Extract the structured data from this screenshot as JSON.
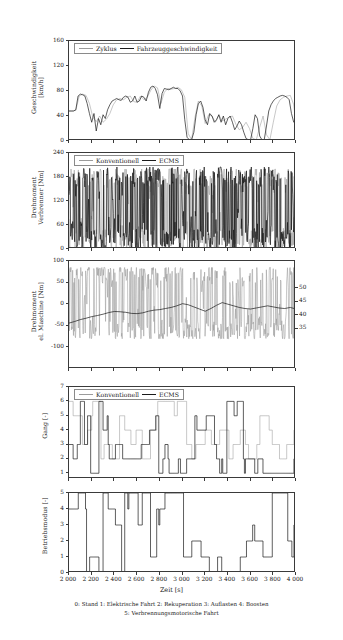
{
  "figure": {
    "width": 343,
    "height": 640,
    "background": "#ffffff",
    "axis_color": "#3a3a3a",
    "grey_series_color": "#9b9b9b",
    "black_series_color": "#1a1a1a"
  },
  "xaxis": {
    "label": "Zeit [s]",
    "ticks": [
      2000,
      2200,
      2400,
      2600,
      2800,
      3000,
      3200,
      3400,
      3600,
      3800,
      4000
    ],
    "tick_labels": [
      "2 000",
      "2 200",
      "2 400",
      "2 600",
      "2 800",
      "3 000",
      "3 200",
      "3 400",
      "3 600",
      "3 800",
      "4 000"
    ],
    "min": 2000,
    "max": 4000
  },
  "caption": {
    "line1": "0: Stand 1: Elektrische Fahrt 2: Rekuperation 3: Auflasten 4: Boosten",
    "line2": "5: Verbrennungsmotorische Fahrt"
  },
  "chart_data": [
    {
      "id": "speed",
      "type": "line",
      "title": "",
      "xlabel": "",
      "ylabel": "Geschwindigkeit\n[km/h]",
      "ylabel_lines": [
        "Geschwindigkeit",
        "[km/h]"
      ],
      "ylim": [
        0,
        160
      ],
      "yticks": [
        0,
        40,
        80,
        120,
        160
      ],
      "ytick_labels": [
        "0",
        "40",
        "80",
        "120",
        "160"
      ],
      "xlim": [
        2000,
        4000
      ],
      "grid": false,
      "legend": {
        "position": "top-left-inside",
        "entries": [
          {
            "name": "Zyklus",
            "color": "#9b9b9b"
          },
          {
            "name": "Fahrzeuggeschwindigkeit",
            "color": "#1a1a1a"
          }
        ]
      },
      "series": [
        {
          "name": "Zyklus",
          "color": "#9b9b9b",
          "x": [
            2000,
            2030,
            2060,
            2090,
            2120,
            2150,
            2180,
            2210,
            2240,
            2270,
            2300,
            2330,
            2360,
            2390,
            2420,
            2450,
            2480,
            2510,
            2540,
            2570,
            2600,
            2630,
            2660,
            2690,
            2720,
            2750,
            2780,
            2810,
            2840,
            2870,
            2900,
            2930,
            2960,
            2990,
            3020,
            3050,
            3080,
            3110,
            3140,
            3170,
            3200,
            3230,
            3260,
            3290,
            3320,
            3350,
            3380,
            3410,
            3440,
            3470,
            3500,
            3530,
            3560,
            3590,
            3620,
            3650,
            3680,
            3710,
            3740,
            3770,
            3800,
            3830,
            3860,
            3890,
            3920,
            3950,
            3980,
            4000
          ],
          "y": [
            48,
            48,
            49,
            72,
            75,
            73,
            60,
            38,
            31,
            40,
            30,
            35,
            44,
            58,
            66,
            68,
            66,
            70,
            72,
            63,
            62,
            72,
            66,
            70,
            81,
            88,
            85,
            60,
            78,
            84,
            83,
            84,
            86,
            82,
            70,
            12,
            2,
            38,
            64,
            56,
            28,
            42,
            40,
            30,
            42,
            32,
            35,
            38,
            40,
            27,
            18,
            22,
            30,
            20,
            4,
            2,
            22,
            40,
            10,
            2,
            30,
            56,
            66,
            70,
            72,
            73,
            58,
            27
          ]
        },
        {
          "name": "Fahrzeuggeschwindigkeit",
          "color": "#1a1a1a",
          "x": [
            2000,
            2020,
            2040,
            2060,
            2080,
            2100,
            2120,
            2140,
            2160,
            2180,
            2200,
            2220,
            2240,
            2260,
            2280,
            2300,
            2320,
            2340,
            2360,
            2380,
            2400,
            2420,
            2440,
            2460,
            2480,
            2500,
            2520,
            2540,
            2560,
            2580,
            2600,
            2620,
            2640,
            2660,
            2680,
            2700,
            2720,
            2740,
            2760,
            2780,
            2800,
            2820,
            2840,
            2860,
            2880,
            2900,
            2920,
            2940,
            2960,
            2980,
            3000,
            3020,
            3040,
            3060,
            3080,
            3100,
            3120,
            3140,
            3160,
            3180,
            3200,
            3220,
            3240,
            3260,
            3280,
            3300,
            3320,
            3340,
            3360,
            3380,
            3400,
            3420,
            3440,
            3460,
            3480,
            3500,
            3520,
            3540,
            3560,
            3580,
            3600,
            3620,
            3640,
            3660,
            3680,
            3700,
            3720,
            3740,
            3760,
            3780,
            3800,
            3820,
            3840,
            3860,
            3880,
            3900,
            3920,
            3940,
            3960,
            3980,
            4000
          ],
          "y": [
            48,
            48,
            48,
            50,
            72,
            75,
            74,
            72,
            60,
            44,
            30,
            44,
            16,
            36,
            26,
            42,
            36,
            50,
            58,
            64,
            66,
            68,
            66,
            65,
            70,
            72,
            70,
            62,
            64,
            72,
            62,
            64,
            72,
            70,
            64,
            78,
            86,
            88,
            84,
            74,
            52,
            76,
            84,
            83,
            82,
            84,
            86,
            84,
            84,
            80,
            72,
            34,
            6,
            2,
            2,
            14,
            42,
            60,
            64,
            54,
            34,
            26,
            44,
            40,
            30,
            34,
            42,
            30,
            40,
            26,
            36,
            40,
            30,
            18,
            24,
            32,
            26,
            14,
            4,
            2,
            2,
            20,
            42,
            36,
            8,
            2,
            2,
            24,
            48,
            58,
            64,
            68,
            70,
            72,
            73,
            72,
            70,
            66,
            44,
            30,
            27
          ]
        }
      ]
    },
    {
      "id": "engine_torque",
      "type": "line",
      "title": "",
      "xlabel": "",
      "ylabel": "Drehmoment\nVerbrenner [Nm]",
      "ylabel_lines": [
        "Drehmoment",
        "Verbrenner [Nm]"
      ],
      "ylim": [
        0,
        240
      ],
      "yticks": [
        0,
        60,
        120,
        180,
        240
      ],
      "ytick_labels": [
        "0",
        "60",
        "120",
        "180",
        "240"
      ],
      "xlim": [
        2000,
        4000
      ],
      "grid": false,
      "legend": {
        "position": "top-left-inside",
        "entries": [
          {
            "name": "Konventionell",
            "color": "#9b9b9b"
          },
          {
            "name": "ECMS",
            "color": "#1a1a1a"
          }
        ]
      },
      "series": [
        {
          "name": "Konventionell",
          "color": "#9b9b9b",
          "seed": 11,
          "style": "dense-spiky",
          "range": [
            0,
            200
          ],
          "mean": 95
        },
        {
          "name": "ECMS",
          "color": "#1a1a1a",
          "seed": 23,
          "style": "dense-spiky",
          "range": [
            0,
            205
          ],
          "mean": 100
        }
      ]
    },
    {
      "id": "motor_torque_soc",
      "type": "line",
      "title": "",
      "xlabel": "",
      "ylabel": "Drehmoment\nel. Maschine [Nm]",
      "ylabel_lines": [
        "Drehmoment",
        "el. Maschine [Nm]"
      ],
      "ylabel_right": "Ladezustand [%]",
      "ylim": [
        -150,
        100
      ],
      "yticks": [
        -100,
        -50,
        0,
        50,
        100
      ],
      "ytick_labels": [
        "-100",
        "-50",
        "0",
        "50",
        "100"
      ],
      "ylim_right": [
        20,
        60
      ],
      "yticks_right": [
        35,
        40,
        45,
        50
      ],
      "ytick_labels_right": [
        "35",
        "40",
        "45",
        "50"
      ],
      "xlim": [
        2000,
        4000
      ],
      "grid": false,
      "legend": null,
      "series": [
        {
          "name": "Drehmoment el. Maschine",
          "color": "#9b9b9b",
          "seed": 7,
          "style": "dense-spiky",
          "range": [
            -80,
            85
          ],
          "mean": 5
        },
        {
          "name": "Ladezustand",
          "color": "#1a1a1a",
          "axis": "right",
          "x": [
            2000,
            2050,
            2100,
            2150,
            2200,
            2250,
            2300,
            2350,
            2400,
            2450,
            2500,
            2550,
            2600,
            2650,
            2700,
            2750,
            2800,
            2850,
            2900,
            2950,
            3000,
            3050,
            3100,
            3150,
            3200,
            3250,
            3300,
            3350,
            3400,
            3450,
            3500,
            3550,
            3600,
            3650,
            3700,
            3750,
            3800,
            3850,
            3900,
            3950,
            4000
          ],
          "y": [
            37.0,
            37.6,
            38.3,
            38.8,
            39.4,
            39.8,
            40.3,
            40.9,
            41.3,
            41.2,
            41.0,
            40.6,
            40.5,
            40.8,
            41.4,
            41.8,
            42.0,
            42.4,
            42.8,
            43.4,
            44.2,
            43.8,
            43.0,
            42.2,
            41.4,
            42.4,
            43.6,
            44.6,
            44.0,
            43.4,
            42.8,
            42.4,
            42.2,
            42.6,
            43.0,
            43.4,
            43.0,
            42.6,
            42.4,
            42.8,
            42.2
          ]
        }
      ]
    },
    {
      "id": "gear",
      "type": "step",
      "title": "",
      "xlabel": "",
      "ylabel": "Gang [-]",
      "ylabel_lines": [
        "Gang [-]"
      ],
      "ylim": [
        0.6,
        7
      ],
      "yticks": [
        1,
        2,
        3,
        4,
        5,
        6,
        7
      ],
      "ytick_labels": [
        "1",
        "2",
        "3",
        "4",
        "5",
        "6",
        "7"
      ],
      "xlim": [
        2000,
        4000
      ],
      "grid": false,
      "legend": {
        "position": "top-left-inside",
        "entries": [
          {
            "name": "Konventionell",
            "color": "#9b9b9b"
          },
          {
            "name": "ECMS",
            "color": "#1a1a1a"
          }
        ]
      },
      "series": [
        {
          "name": "Konventionell",
          "color": "#9b9b9b",
          "seed": 3,
          "style": "step-levels",
          "levels": [
            1,
            2,
            3,
            4,
            5,
            6
          ],
          "base": 4
        },
        {
          "name": "ECMS",
          "color": "#1a1a1a",
          "seed": 17,
          "style": "step-levels",
          "levels": [
            1,
            2,
            3,
            4,
            5,
            6
          ],
          "base": 4
        }
      ]
    },
    {
      "id": "mode",
      "type": "step",
      "title": "",
      "xlabel": "Zeit [s]",
      "ylabel": "Betriebsmodus [-]",
      "ylabel_lines": [
        "Betriebsmodus [-]"
      ],
      "ylim": [
        0,
        5
      ],
      "yticks": [
        0,
        1,
        2,
        3,
        4,
        5
      ],
      "ytick_labels": [
        "0",
        "1",
        "2",
        "3",
        "4",
        "5"
      ],
      "xlim": [
        2000,
        4000
      ],
      "grid": false,
      "legend": null,
      "series": [
        {
          "name": "Betriebsmodus",
          "color": "#1a1a1a",
          "seed": 29,
          "style": "step-levels",
          "levels": [
            0,
            1,
            2,
            3,
            4,
            5
          ],
          "base": 3
        }
      ]
    }
  ]
}
